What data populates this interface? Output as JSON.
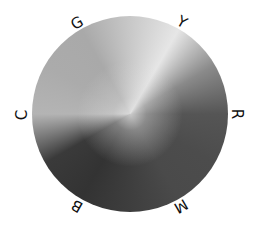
{
  "diagram": {
    "type": "hue-wheel",
    "rendering": "grayscale",
    "labels": [
      {
        "letter": "G",
        "name": "green"
      },
      {
        "letter": "Y",
        "name": "yellow"
      },
      {
        "letter": "R",
        "name": "red"
      },
      {
        "letter": "M",
        "name": "magenta"
      },
      {
        "letter": "B",
        "name": "blue"
      },
      {
        "letter": "C",
        "name": "cyan"
      }
    ]
  }
}
